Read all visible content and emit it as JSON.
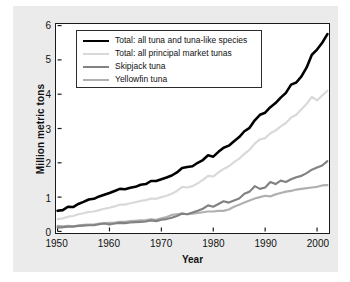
{
  "chart_data": {
    "type": "line",
    "title": "",
    "xlabel": "Year",
    "ylabel": "Million metric tons",
    "xlim": [
      1950,
      2002
    ],
    "ylim": [
      0,
      6
    ],
    "xticks": [
      1950,
      1960,
      1970,
      1980,
      1990,
      2000
    ],
    "yticks": [
      0,
      1,
      2,
      3,
      4,
      5,
      6
    ],
    "grid": false,
    "legend_position": "top-left",
    "x": [
      1950,
      1951,
      1952,
      1953,
      1954,
      1955,
      1956,
      1957,
      1958,
      1959,
      1960,
      1961,
      1962,
      1963,
      1964,
      1965,
      1966,
      1967,
      1968,
      1969,
      1970,
      1971,
      1972,
      1973,
      1974,
      1975,
      1976,
      1977,
      1978,
      1979,
      1980,
      1981,
      1982,
      1983,
      1984,
      1985,
      1986,
      1987,
      1988,
      1989,
      1990,
      1991,
      1992,
      1993,
      1994,
      1995,
      1996,
      1997,
      1998,
      1999,
      2000,
      2001,
      2002
    ],
    "series": [
      {
        "name": "Total: all tuna and tuna-like species",
        "color": "#000000",
        "width": 2.6,
        "values": [
          0.6,
          0.62,
          0.72,
          0.71,
          0.8,
          0.86,
          0.93,
          0.95,
          1.02,
          1.07,
          1.12,
          1.18,
          1.24,
          1.23,
          1.27,
          1.3,
          1.36,
          1.38,
          1.47,
          1.47,
          1.52,
          1.57,
          1.63,
          1.72,
          1.85,
          1.88,
          1.9,
          2.0,
          2.08,
          2.22,
          2.18,
          2.32,
          2.44,
          2.5,
          2.63,
          2.75,
          2.92,
          3.02,
          3.24,
          3.4,
          3.46,
          3.62,
          3.74,
          3.9,
          4.04,
          4.28,
          4.34,
          4.52,
          4.78,
          5.15,
          5.3,
          5.5,
          5.75
        ]
      },
      {
        "name": "Total: all principal market tunas",
        "color": "#d9d9d9",
        "width": 2.2,
        "values": [
          0.36,
          0.38,
          0.43,
          0.45,
          0.5,
          0.53,
          0.57,
          0.58,
          0.62,
          0.66,
          0.69,
          0.73,
          0.78,
          0.78,
          0.82,
          0.85,
          0.89,
          0.91,
          0.96,
          0.95,
          1.0,
          1.04,
          1.1,
          1.18,
          1.3,
          1.28,
          1.32,
          1.4,
          1.5,
          1.62,
          1.6,
          1.72,
          1.82,
          1.9,
          2.02,
          2.12,
          2.26,
          2.38,
          2.56,
          2.68,
          2.72,
          2.86,
          2.94,
          3.06,
          3.16,
          3.32,
          3.4,
          3.56,
          3.72,
          3.92,
          3.82,
          3.96,
          4.1
        ]
      },
      {
        "name": "Skipjack tuna",
        "color": "#828282",
        "width": 2.2,
        "values": [
          0.12,
          0.12,
          0.14,
          0.14,
          0.16,
          0.17,
          0.18,
          0.18,
          0.21,
          0.23,
          0.2,
          0.23,
          0.25,
          0.24,
          0.26,
          0.27,
          0.28,
          0.29,
          0.32,
          0.3,
          0.34,
          0.36,
          0.4,
          0.45,
          0.52,
          0.5,
          0.55,
          0.6,
          0.66,
          0.76,
          0.72,
          0.8,
          0.88,
          0.84,
          0.9,
          0.96,
          1.1,
          1.16,
          1.32,
          1.24,
          1.28,
          1.44,
          1.38,
          1.48,
          1.44,
          1.52,
          1.58,
          1.62,
          1.7,
          1.8,
          1.86,
          1.92,
          2.05
        ]
      },
      {
        "name": "Yellowfin tuna",
        "color": "#b0b0b0",
        "width": 2.2,
        "values": [
          0.16,
          0.15,
          0.16,
          0.15,
          0.17,
          0.19,
          0.2,
          0.2,
          0.23,
          0.24,
          0.25,
          0.26,
          0.28,
          0.28,
          0.3,
          0.31,
          0.32,
          0.33,
          0.35,
          0.34,
          0.38,
          0.42,
          0.48,
          0.5,
          0.52,
          0.5,
          0.52,
          0.54,
          0.56,
          0.58,
          0.58,
          0.6,
          0.6,
          0.64,
          0.72,
          0.78,
          0.84,
          0.9,
          0.96,
          1.0,
          1.04,
          1.02,
          1.08,
          1.12,
          1.16,
          1.18,
          1.22,
          1.24,
          1.26,
          1.28,
          1.3,
          1.34,
          1.35
        ]
      }
    ]
  },
  "legend": {
    "items": [
      {
        "label": "Total: all tuna and tuna-like species"
      },
      {
        "label": "Total: all principal market tunas"
      },
      {
        "label": "Skipjack tuna"
      },
      {
        "label": "Yellowfin tuna"
      }
    ]
  }
}
